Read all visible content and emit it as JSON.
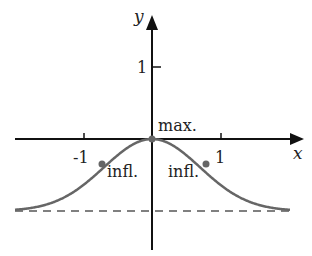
{
  "chart_data": {
    "type": "line",
    "title": "",
    "xlabel": "x",
    "ylabel": "y",
    "function": "y = exp(-x^2) - 1",
    "xlim": [
      -2.1,
      2.1
    ],
    "ylim": [
      -1.5,
      1.5
    ],
    "grid": false,
    "legend": null,
    "x_ticks": [
      {
        "value": -1,
        "label": "-1"
      },
      {
        "value": 1,
        "label": "1"
      }
    ],
    "y_ticks": [
      {
        "value": 1,
        "label": "1"
      }
    ],
    "series": [
      {
        "name": "curve",
        "color": "#666666",
        "x": [
          -2.0,
          -1.75,
          -1.5,
          -1.25,
          -1.0,
          -0.75,
          -0.5,
          -0.25,
          0,
          0.25,
          0.5,
          0.75,
          1.0,
          1.25,
          1.5,
          1.75,
          2.0
        ],
        "y": [
          -0.98,
          -0.95,
          -0.89,
          -0.79,
          -0.63,
          -0.43,
          -0.22,
          -0.06,
          0,
          -0.06,
          -0.22,
          -0.43,
          -0.63,
          -0.79,
          -0.89,
          -0.95,
          -0.98
        ]
      }
    ],
    "asymptote": {
      "y": -1,
      "style": "dashed",
      "color": "#777777"
    },
    "points": [
      {
        "x": 0,
        "y": 0,
        "label": "max."
      },
      {
        "x": -0.707,
        "y": -0.39,
        "label": "infl."
      },
      {
        "x": 0.707,
        "y": -0.39,
        "label": "infl."
      }
    ]
  },
  "labels": {
    "x_axis": "x",
    "y_axis": "y",
    "tick_x_neg1": "-1",
    "tick_x_pos1": "1",
    "tick_y_1": "1",
    "max": "max.",
    "infl_left": "infl.",
    "infl_right": "infl."
  },
  "colors": {
    "axes": "#111111",
    "curve": "#666666",
    "asymptote": "#808080",
    "points": "#666666"
  }
}
